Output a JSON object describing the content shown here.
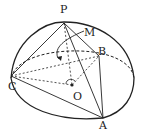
{
  "diagram": {
    "type": "hemisphere-geometry",
    "colors": {
      "stroke": "#222222",
      "background": "#ffffff"
    },
    "labels": {
      "P": "P",
      "M": "M",
      "B": "B",
      "C": "C",
      "O": "O",
      "A": "A"
    },
    "points": {
      "P": [
        64,
        23
      ],
      "B": [
        99,
        56
      ],
      "C": [
        11,
        76
      ],
      "O": [
        72,
        85
      ],
      "A": [
        103,
        118
      ]
    },
    "solid_segments": [
      [
        "P",
        "C"
      ],
      [
        "P",
        "B"
      ],
      [
        "P",
        "A"
      ],
      [
        "C",
        "A"
      ],
      [
        "B",
        "A"
      ]
    ],
    "dashed_segments": [
      [
        "P",
        "O"
      ],
      [
        "C",
        "B"
      ],
      [
        "C",
        "O"
      ],
      [
        "O",
        "B"
      ]
    ]
  }
}
